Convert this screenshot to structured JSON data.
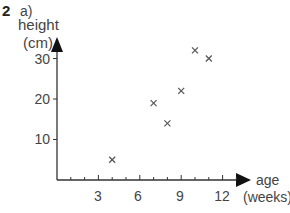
{
  "question": {
    "number": "2",
    "part": "a)"
  },
  "chart_data": {
    "type": "scatter",
    "title": "",
    "xlabel": "age (weeks)",
    "ylabel": "height (cm)",
    "xlabel_lines": [
      "age",
      "(weeks)"
    ],
    "ylabel_lines": [
      "height",
      "(cm)"
    ],
    "x_ticks": [
      3,
      6,
      9,
      12
    ],
    "y_ticks": [
      10,
      20,
      30
    ],
    "xlim": [
      0,
      13.5
    ],
    "ylim": [
      0,
      33
    ],
    "marker": "x",
    "grid": false,
    "points": [
      {
        "x": 4,
        "y": 5
      },
      {
        "x": 7,
        "y": 19
      },
      {
        "x": 8,
        "y": 14
      },
      {
        "x": 9,
        "y": 22
      },
      {
        "x": 10,
        "y": 32
      },
      {
        "x": 11,
        "y": 30
      }
    ]
  },
  "colors": {
    "axis": "#333333",
    "marker": "#555555",
    "text": "#444444"
  }
}
